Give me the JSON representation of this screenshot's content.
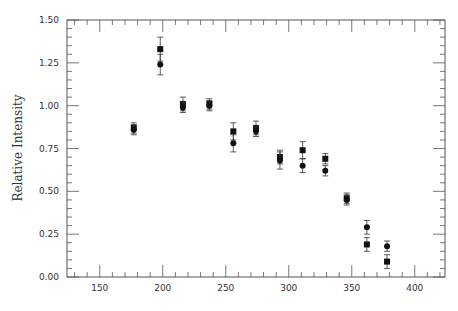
{
  "caption_fragment": "",
  "chart_data": {
    "type": "scatter",
    "title": "",
    "xlabel": "",
    "ylabel": "Relative Intensity",
    "xlim": [
      124,
      424
    ],
    "ylim": [
      0.0,
      1.5
    ],
    "x_major_ticks": [
      150,
      200,
      250,
      300,
      350,
      400
    ],
    "x_minor_step": 10,
    "y_major_ticks": [
      0.0,
      0.25,
      0.5,
      0.75,
      1.0,
      1.25,
      1.5
    ],
    "y_tick_labels": [
      "0.00",
      "0.25",
      "0.50",
      "0.75",
      "1.00",
      "1.25",
      "1.50"
    ],
    "y_minor_step": 0.05,
    "grid": false,
    "legend": null,
    "series": [
      {
        "name": "squares",
        "marker": "square",
        "color": "#111111",
        "x": [
          177,
          198,
          216,
          237,
          256,
          274,
          293,
          311,
          329,
          346,
          362,
          378
        ],
        "y": [
          0.87,
          1.33,
          1.01,
          1.01,
          0.85,
          0.87,
          0.7,
          0.74,
          0.69,
          0.46,
          0.19,
          0.09
        ],
        "yerr": [
          0.03,
          0.07,
          0.04,
          0.03,
          0.05,
          0.04,
          0.04,
          0.05,
          0.03,
          0.03,
          0.04,
          0.04
        ]
      },
      {
        "name": "circles",
        "marker": "circle",
        "color": "#111111",
        "x": [
          177,
          198,
          216,
          237,
          256,
          274,
          293,
          311,
          329,
          346,
          362,
          378
        ],
        "y": [
          0.86,
          1.24,
          0.99,
          1.0,
          0.78,
          0.85,
          0.68,
          0.65,
          0.62,
          0.45,
          0.29,
          0.18
        ],
        "yerr": [
          0.03,
          0.06,
          0.03,
          0.03,
          0.05,
          0.03,
          0.05,
          0.04,
          0.03,
          0.03,
          0.04,
          0.03
        ]
      }
    ]
  },
  "layout": {
    "plot_left": 67,
    "plot_right": 445,
    "plot_top": 20,
    "plot_bottom": 277,
    "axis_color": "#555555",
    "marker_size": 6
  }
}
